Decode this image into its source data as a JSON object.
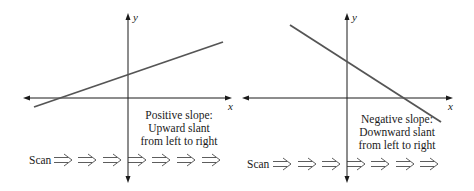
{
  "diagram": {
    "panels": [
      {
        "id": "positive",
        "y_label": "y",
        "x_label": "x",
        "caption": [
          "Positive slope:",
          "Upward slant",
          "from left to right"
        ],
        "scan_label": "Scan",
        "arrow_count": 7,
        "line": {
          "x1": 34,
          "y1": 107,
          "x2": 223,
          "y2": 42
        },
        "axis_origin": {
          "x": 128,
          "y": 98
        },
        "x_axis": {
          "x1": 23,
          "x2": 231
        },
        "y_axis": {
          "y1": 13,
          "y2": 183
        },
        "colors": {
          "axis": "#1a1a1a",
          "line": "#555555"
        }
      },
      {
        "id": "negative",
        "y_label": "y",
        "x_label": "x",
        "caption": [
          "Negative slope:",
          "Downward slant",
          "from left to right"
        ],
        "scan_label": "Scan",
        "arrow_count": 7,
        "line": {
          "x1": 290,
          "y1": 25,
          "x2": 441,
          "y2": 122
        },
        "axis_origin": {
          "x": 347,
          "y": 98
        },
        "x_axis": {
          "x1": 242,
          "x2": 453
        },
        "y_axis": {
          "y1": 13,
          "y2": 183
        },
        "colors": {
          "axis": "#1a1a1a",
          "line": "#555555"
        }
      }
    ]
  }
}
